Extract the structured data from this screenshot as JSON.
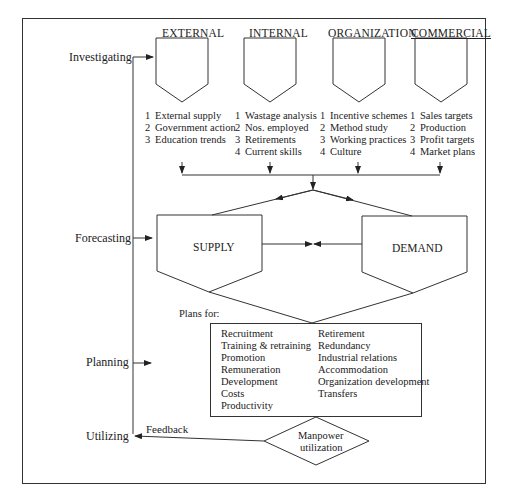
{
  "stages": [
    {
      "label": "Investigating"
    },
    {
      "label": "Forecasting"
    },
    {
      "label": "Planning"
    },
    {
      "label": "Utilizing"
    }
  ],
  "categories": [
    {
      "title": "EXTERNAL",
      "items": [
        {
          "n": "1",
          "text": "External supply"
        },
        {
          "n": "2",
          "text": "Government action"
        },
        {
          "n": "3",
          "text": "Education trends"
        }
      ]
    },
    {
      "title": "INTERNAL",
      "items": [
        {
          "n": "1",
          "text": "Wastage analysis"
        },
        {
          "n": "2",
          "text": "Nos. employed"
        },
        {
          "n": "3",
          "text": "Retirements"
        },
        {
          "n": "4",
          "text": "Current skills"
        }
      ]
    },
    {
      "title": "ORGANIZATION",
      "items": [
        {
          "n": "1",
          "text": "Incentive schemes"
        },
        {
          "n": "2",
          "text": "Method study"
        },
        {
          "n": "3",
          "text": "Working practices"
        },
        {
          "n": "4",
          "text": "Culture"
        }
      ]
    },
    {
      "title": "COMMERCIAL",
      "items": [
        {
          "n": "1",
          "text": "Sales targets"
        },
        {
          "n": "2",
          "text": "Production"
        },
        {
          "n": "3",
          "text": "Profit targets"
        },
        {
          "n": "4",
          "text": "Market plans"
        }
      ]
    }
  ],
  "forecast": {
    "supply": "SUPPLY",
    "demand": "DEMAND"
  },
  "plans": {
    "label": "Plans for:",
    "left": [
      "Recruitment",
      "Training & retraining",
      "Promotion",
      "Remuneration",
      "Development",
      "Costs",
      "Productivity"
    ],
    "right": [
      "Retirement",
      "Redundancy",
      "Industrial relations",
      "Accommodation",
      "Organization development",
      "Transfers"
    ]
  },
  "utilization": {
    "line1": "Manpower",
    "line2": "utilization",
    "feedback": "Feedback"
  }
}
